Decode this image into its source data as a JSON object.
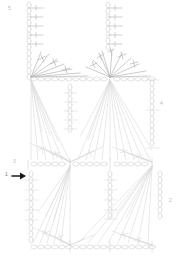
{
  "document": {
    "kind": "crochet-chart-diagram",
    "title": "",
    "canvas": {
      "width": 181,
      "height": 265,
      "background": "#ffffff"
    }
  },
  "colors": {
    "chain_stroke": "#d9d9d9",
    "stitch_stroke": "#cfcfcf",
    "fan_stroke": "#d4d4d4",
    "dark_stitch_stroke": "#a8a8a8",
    "label_text": "#b9b9b9",
    "arrow": "#1a1a1a"
  },
  "labels": [
    {
      "id": "label-5",
      "text": "5",
      "x": 8,
      "y": 6
    },
    {
      "id": "label-4",
      "text": "4",
      "x": 160,
      "y": 101
    },
    {
      "id": "label-3",
      "text": "3",
      "x": 13,
      "y": 159
    },
    {
      "id": "label-1",
      "text": "1",
      "x": 5,
      "y": 172
    },
    {
      "id": "label-2",
      "text": "2",
      "x": 169,
      "y": 198
    }
  ],
  "markers": {
    "start_arrow": {
      "name": "start-direction-arrow",
      "direction": "right",
      "x": 12,
      "y": 176,
      "length": 14
    }
  },
  "structure": {
    "straps": [
      {
        "name": "left-strap",
        "chain_x": 29,
        "top_y": 3,
        "bottom_y": 78,
        "links": 13,
        "cross_marks": 5
      },
      {
        "name": "right-strap",
        "chain_x": 108,
        "top_y": 3,
        "bottom_y": 50,
        "links": 8,
        "cross_marks": 5
      }
    ],
    "anchor_points": [
      {
        "name": "anchor-top-left",
        "x": 31,
        "y": 78
      },
      {
        "name": "anchor-top-right",
        "x": 110,
        "y": 78
      },
      {
        "name": "anchor-mid-left",
        "x": 70,
        "y": 164
      },
      {
        "name": "anchor-mid-right",
        "x": 152,
        "y": 164
      },
      {
        "name": "anchor-bottom-left",
        "x": 70,
        "y": 247
      },
      {
        "name": "anchor-bottom-right",
        "x": 152,
        "y": 247
      }
    ],
    "chain_rows": [
      {
        "name": "chain-row-neckline",
        "y": 78,
        "x_start": 28,
        "x_end": 152
      },
      {
        "name": "chain-row-middle",
        "y": 164,
        "x_start": 28,
        "x_end": 160
      },
      {
        "name": "chain-row-bottom",
        "y": 247,
        "x_start": 28,
        "x_end": 155
      }
    ],
    "chain_columns": [
      {
        "name": "chain-col-center-upper",
        "x": 70,
        "top_y": 85,
        "bottom_y": 131
      },
      {
        "name": "chain-col-right-edge",
        "x": 152,
        "top_y": 78,
        "bottom_y": 148
      },
      {
        "name": "chain-col-left-lower",
        "x": 31,
        "top_y": 172,
        "bottom_y": 245
      },
      {
        "name": "chain-col-center-lower",
        "x": 110,
        "top_y": 172,
        "bottom_y": 218
      },
      {
        "name": "chain-col-right-lower",
        "x": 160,
        "top_y": 172,
        "bottom_y": 218
      }
    ],
    "fans": [
      {
        "name": "fan-neckline-left",
        "apex_x": 31,
        "apex_y": 78,
        "spread": "upward-right",
        "rays": 7
      },
      {
        "name": "fan-neckline-right",
        "apex_x": 110,
        "apex_y": 78,
        "spread": "upward-both",
        "rays": 9
      },
      {
        "name": "fan-body-left",
        "apex_x": 31,
        "apex_y": 80,
        "spread": "downward",
        "rays": 9
      },
      {
        "name": "fan-body-right",
        "apex_x": 110,
        "apex_y": 80,
        "spread": "downward",
        "rays": 11
      },
      {
        "name": "fan-mid-left",
        "apex_x": 70,
        "apex_y": 164,
        "spread": "upward",
        "rays": 9
      },
      {
        "name": "fan-mid-right",
        "apex_x": 152,
        "apex_y": 164,
        "spread": "upward",
        "rays": 9
      },
      {
        "name": "fan-lower-left",
        "apex_x": 70,
        "apex_y": 166,
        "spread": "downward",
        "rays": 11
      },
      {
        "name": "fan-lower-right",
        "apex_x": 152,
        "apex_y": 166,
        "spread": "downward",
        "rays": 9
      },
      {
        "name": "fan-bottom-left",
        "apex_x": 70,
        "apex_y": 247,
        "spread": "upward",
        "rays": 9
      },
      {
        "name": "fan-bottom-right",
        "apex_x": 152,
        "apex_y": 247,
        "spread": "upward",
        "rays": 9
      }
    ]
  }
}
